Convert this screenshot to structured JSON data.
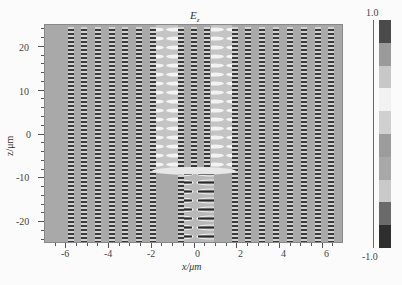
{
  "chart_data": {
    "type": "heatmap",
    "title_main": "E",
    "title_sub": "z",
    "xlabel": "x/μm",
    "ylabel": "z/μm",
    "xlim": [
      -7,
      7
    ],
    "ylim": [
      -25,
      25
    ],
    "xticks": [
      "-6",
      "-4",
      "-2",
      "0",
      "2",
      "4",
      "6"
    ],
    "yticks": [
      "20",
      "10",
      "0",
      "-10",
      "-20"
    ],
    "colorbar": {
      "min_label": "-1.0",
      "max_label": "1.0",
      "range": [
        -1.0,
        1.0
      ],
      "levels": 10,
      "colors": [
        "#4a4a4a",
        "#9a9a9a",
        "#c8c8c8",
        "#f2f2f2",
        "#d0d0d0",
        "#9c9c9c",
        "#a8a8a8",
        "#c9c9c9",
        "#6a6a6a",
        "#2e2e2e"
      ]
    },
    "grid": false
  }
}
